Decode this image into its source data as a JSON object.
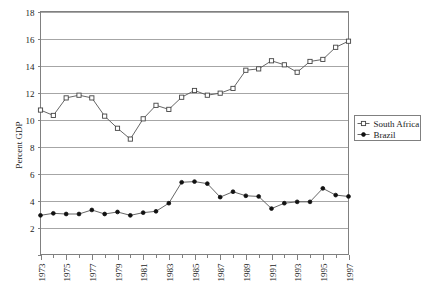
{
  "chart_data": {
    "type": "line",
    "title": "",
    "subtitle": "",
    "xlabel": "",
    "ylabel": "Percent GDP",
    "xlim": [
      1973,
      1997
    ],
    "ylim": [
      0,
      18
    ],
    "y_ticks": [
      0,
      2,
      4,
      6,
      8,
      10,
      12,
      14,
      16,
      18
    ],
    "y_tick_labels": [
      "",
      "2",
      "4",
      "6",
      "8",
      "10",
      "12",
      "14",
      "16",
      "18"
    ],
    "x": [
      1973,
      1974,
      1975,
      1976,
      1977,
      1978,
      1979,
      1980,
      1981,
      1982,
      1983,
      1984,
      1985,
      1986,
      1987,
      1988,
      1989,
      1990,
      1991,
      1992,
      1993,
      1994,
      1995,
      1996,
      1997
    ],
    "x_tick_labels": [
      "1973",
      "1975",
      "1977",
      "1979",
      "1981",
      "1983",
      "1985",
      "1987",
      "1989",
      "1991",
      "1993",
      "1995",
      "1997"
    ],
    "x_labeled_years": [
      1973,
      1975,
      1977,
      1979,
      1981,
      1983,
      1985,
      1987,
      1989,
      1991,
      1993,
      1995,
      1997
    ],
    "grid": "horizontal",
    "legend_position": "right-outside",
    "series": [
      {
        "name": "South Africa",
        "marker": "open-circle",
        "values": [
          10.7,
          10.3,
          11.6,
          11.8,
          11.6,
          10.25,
          9.35,
          8.55,
          10.05,
          11.05,
          10.75,
          11.65,
          12.15,
          11.8,
          11.95,
          12.3,
          13.65,
          13.75,
          14.35,
          14.05,
          13.5,
          14.3,
          14.45,
          15.35,
          15.8
        ]
      },
      {
        "name": "Brazil",
        "marker": "filled-circle",
        "values": [
          2.9,
          3.05,
          3.0,
          3.0,
          3.3,
          3.0,
          3.15,
          2.9,
          3.1,
          3.2,
          3.8,
          5.35,
          5.4,
          5.25,
          4.25,
          4.65,
          4.35,
          4.3,
          3.4,
          3.8,
          3.9,
          3.9,
          4.9,
          4.4,
          4.3
        ]
      }
    ]
  },
  "legend": {
    "entries": [
      {
        "label": "South Africa"
      },
      {
        "label": "Brazil"
      }
    ]
  }
}
